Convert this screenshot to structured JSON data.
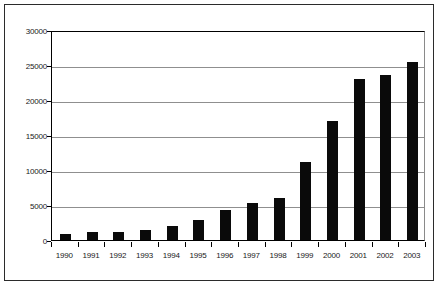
{
  "chart_data": {
    "type": "bar",
    "title": "",
    "subtitle": "",
    "xlabel": "",
    "ylabel": "",
    "categories": [
      "1990",
      "1991",
      "1992",
      "1993",
      "1994",
      "1995",
      "1996",
      "1997",
      "1998",
      "1999",
      "2000",
      "2001",
      "2002",
      "2003"
    ],
    "values": [
      800,
      1150,
      1200,
      1450,
      2050,
      2800,
      4350,
      5250,
      6050,
      11100,
      17000,
      23000,
      23600,
      25400
    ],
    "series": [
      {
        "name": "",
        "values": [
          800,
          1150,
          1200,
          1450,
          2050,
          2800,
          4350,
          5250,
          6050,
          11100,
          17000,
          23000,
          23600,
          25400
        ]
      }
    ],
    "ylim": [
      0,
      30000
    ],
    "yticks": [
      0,
      5000,
      10000,
      15000,
      20000,
      25000,
      30000
    ],
    "ytick_labels": [
      "0",
      "5000",
      "10000",
      "15000",
      "20000",
      "25000",
      "30000"
    ],
    "grid": "horizontal",
    "legend": "none",
    "bar_color": "#0a0a0a",
    "grid_color": "#8f8f8f",
    "axis_color": "#000000",
    "background_color": "#ffffff",
    "frame_color": "#2b2b2b"
  }
}
